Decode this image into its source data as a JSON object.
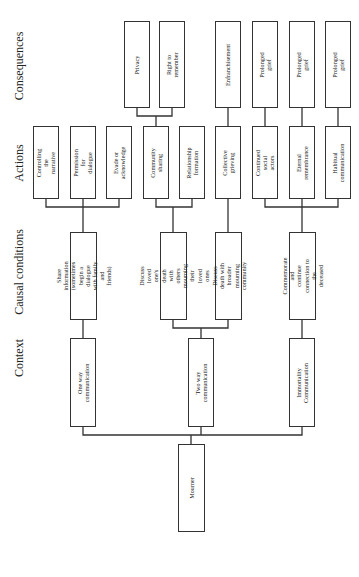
{
  "headers": {
    "consequences": "Consequences",
    "actions": "Actions",
    "causal_conditions": "Causal conditions",
    "context": "Context"
  },
  "root": {
    "label": "Mourner"
  },
  "context": [
    {
      "label": "One way communication"
    },
    {
      "label": "Two way communication"
    },
    {
      "label": "Immortality\nCommunication"
    }
  ],
  "causal_conditions": [
    {
      "label": "Share information\n(sometimes begin a dialogue\nwith family and friends)"
    },
    {
      "label": "Discuss loved one's death\nwith others mourning their\nloved ones"
    },
    {
      "label": "Discuss death with broader\nmourning community"
    },
    {
      "label": "Commemorate and\ncontinue connection to the\ndeceased"
    }
  ],
  "actions": [
    {
      "label": "Controlling the narrative"
    },
    {
      "label": "Permission for dialogue"
    },
    {
      "label": "Evade or acknowledge"
    },
    {
      "label": "Community sharing"
    },
    {
      "label": "Relationship formation"
    },
    {
      "label": "Collective grieving"
    },
    {
      "label": "Continued social actors"
    },
    {
      "label": "Eternal remembrance"
    },
    {
      "label": "Habitual communication"
    }
  ],
  "consequences": [
    {
      "label": "Privacy"
    },
    {
      "label": "Right to remember"
    },
    {
      "label": "Enfranchisement"
    },
    {
      "label": "Prolonged grief"
    },
    {
      "label": "Prolonged grief"
    },
    {
      "label": "Prolonged grief"
    }
  ]
}
